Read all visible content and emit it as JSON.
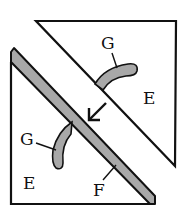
{
  "diagram": {
    "colors": {
      "stroke": "#111111",
      "fill_grey": "#a8a8a8",
      "background": "#ffffff"
    },
    "labels": {
      "upper_g": "G",
      "upper_e": "E",
      "lower_g": "G",
      "lower_e": "E",
      "strip_f": "F"
    },
    "arrow": {
      "direction": "down-left"
    }
  }
}
